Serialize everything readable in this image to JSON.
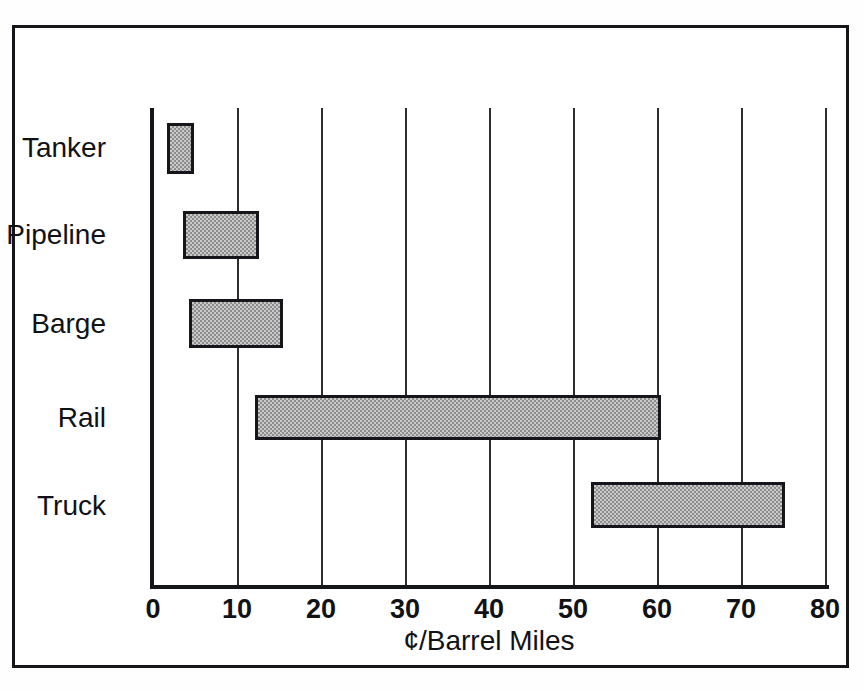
{
  "chart_data": {
    "type": "bar",
    "orientation": "horizontal",
    "subtype": "range-bar",
    "title": "",
    "xlabel": "¢/Barrel Miles",
    "ylabel": "",
    "xlim": [
      0,
      80
    ],
    "ylim": null,
    "xticks": [
      0,
      10,
      20,
      30,
      40,
      50,
      60,
      70,
      80
    ],
    "xtick_labels": [
      "0",
      "10",
      "20",
      "30",
      "40",
      "50",
      "60",
      "70",
      "80"
    ],
    "grid": "vertical",
    "legend": null,
    "categories": [
      "Tanker",
      "Pipeline",
      "Barge",
      "Rail",
      "Truck"
    ],
    "ranges": [
      {
        "category": "Tanker",
        "low": 1.7,
        "high": 4.9
      },
      {
        "category": "Pipeline",
        "low": 3.6,
        "high": 12.6
      },
      {
        "category": "Barge",
        "low": 4.3,
        "high": 15.5
      },
      {
        "category": "Rail",
        "low": 12.1,
        "high": 60.5
      },
      {
        "category": "Truck",
        "low": 52.1,
        "high": 75.2
      }
    ],
    "colors": {
      "bar_fill": "#c9c9c9",
      "bar_pattern": "#8d8d8d",
      "bar_edge": "#15161a",
      "axis": "#15161a",
      "grid": "#2c2d31",
      "text": "#111216",
      "background": "#ffffff"
    }
  },
  "figure": {
    "frame_border_color": "#15161a"
  }
}
